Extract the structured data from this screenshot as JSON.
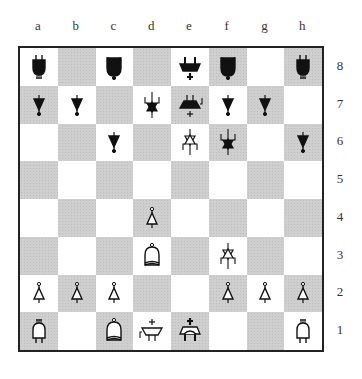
{
  "board": {
    "files": [
      "a",
      "b",
      "c",
      "d",
      "e",
      "f",
      "g",
      "h"
    ],
    "ranks": [
      "8",
      "7",
      "6",
      "5",
      "4",
      "3",
      "2",
      "1"
    ],
    "colors": {
      "light": "#ffffff",
      "dark": "#cfcfcf",
      "border": "#222222"
    },
    "pieces": {
      "a8": {
        "color": "black",
        "type": "rook"
      },
      "c8": {
        "color": "black",
        "type": "bishop"
      },
      "e8": {
        "color": "black",
        "type": "king"
      },
      "f8": {
        "color": "black",
        "type": "bishop"
      },
      "h8": {
        "color": "black",
        "type": "rook"
      },
      "a7": {
        "color": "black",
        "type": "pawn"
      },
      "b7": {
        "color": "black",
        "type": "pawn"
      },
      "d7": {
        "color": "black",
        "type": "knight"
      },
      "e7": {
        "color": "black",
        "type": "queen"
      },
      "f7": {
        "color": "black",
        "type": "pawn"
      },
      "g7": {
        "color": "black",
        "type": "pawn"
      },
      "c6": {
        "color": "black",
        "type": "pawn"
      },
      "e6": {
        "color": "white",
        "type": "knight"
      },
      "f6": {
        "color": "black",
        "type": "knight"
      },
      "h6": {
        "color": "black",
        "type": "pawn"
      },
      "d4": {
        "color": "white",
        "type": "pawn"
      },
      "d3": {
        "color": "white",
        "type": "bishop"
      },
      "f3": {
        "color": "white",
        "type": "knight"
      },
      "a2": {
        "color": "white",
        "type": "pawn"
      },
      "b2": {
        "color": "white",
        "type": "pawn"
      },
      "c2": {
        "color": "white",
        "type": "pawn"
      },
      "f2": {
        "color": "white",
        "type": "pawn"
      },
      "g2": {
        "color": "white",
        "type": "pawn"
      },
      "h2": {
        "color": "white",
        "type": "pawn"
      },
      "a1": {
        "color": "white",
        "type": "rook"
      },
      "c1": {
        "color": "white",
        "type": "bishop"
      },
      "d1": {
        "color": "white",
        "type": "queen"
      },
      "e1": {
        "color": "white",
        "type": "king"
      },
      "h1": {
        "color": "white",
        "type": "rook"
      }
    }
  }
}
